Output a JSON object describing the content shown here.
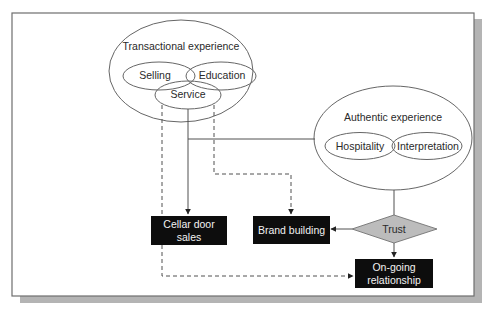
{
  "diagram": {
    "type": "flow-diagram",
    "colors": {
      "frame_border": "#6e6e6e",
      "shadow": "#b4b4b4",
      "line": "#505050",
      "box_fill": "#0d0d0d",
      "box_text": "#f2f2f2",
      "diamond_fill": "#bcbcbc",
      "text": "#2a2a2a"
    },
    "clusters": {
      "transactional": {
        "title": "Transactional experience",
        "items": [
          "Selling",
          "Education",
          "Service"
        ]
      },
      "authentic": {
        "title": "Authentic experience",
        "items": [
          "Hospitality",
          "Interpretation"
        ]
      }
    },
    "outcomes": {
      "cellar_door": [
        "Cellar door",
        "sales"
      ],
      "brand_building": "Brand building",
      "trust": "Trust",
      "ongoing": [
        "On-going",
        "relationship"
      ]
    },
    "edges": [
      {
        "from": "Service",
        "to": "Cellar door sales",
        "style": "solid"
      },
      {
        "from": "Service",
        "to": "Brand building",
        "style": "dashed"
      },
      {
        "from": "Service",
        "to": "On-going relationship",
        "style": "dashed"
      },
      {
        "from": "Service",
        "to": "Authentic experience",
        "style": "solid"
      },
      {
        "from": "Authentic experience",
        "to": "Trust",
        "style": "solid"
      },
      {
        "from": "Trust",
        "to": "Brand building",
        "style": "solid"
      },
      {
        "from": "Trust",
        "to": "On-going relationship",
        "style": "solid"
      }
    ]
  }
}
